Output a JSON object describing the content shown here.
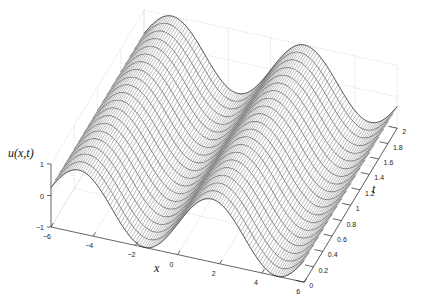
{
  "chart_data": {
    "type": "surface",
    "title": "",
    "xlabel": "x",
    "ylabel": "t",
    "zlabel": "u(x,t)",
    "function": "u(x,t) = cos(x - 1.6)",
    "xlim": [
      -6,
      6
    ],
    "tlim": [
      0,
      2
    ],
    "zlim": [
      -1,
      1
    ],
    "x_ticks": [
      -6,
      -4,
      -2,
      0,
      2,
      4,
      6
    ],
    "x_tick_labels": [
      "−6",
      "−4",
      "−2",
      "0",
      "2",
      "4",
      "6"
    ],
    "t_ticks": [
      0,
      0.2,
      0.4,
      0.6,
      0.8,
      1,
      1.2,
      1.4,
      1.6,
      1.8,
      2
    ],
    "t_tick_labels": [
      "0",
      "0.2",
      "0.4",
      "0.6",
      "0.8",
      "1",
      "1.2",
      "1.4",
      "1.6",
      "1.8",
      "2"
    ],
    "z_ticks": [
      -1,
      0,
      1
    ],
    "z_tick_labels": [
      "−1",
      "0",
      "1"
    ],
    "grid": true,
    "mesh": {
      "x_samples": 121,
      "t_samples": 21,
      "edge_color": "#333333",
      "face_color": "#ffffff",
      "hatch_color": "#777777"
    },
    "grid_color": "#bbbbbb"
  }
}
